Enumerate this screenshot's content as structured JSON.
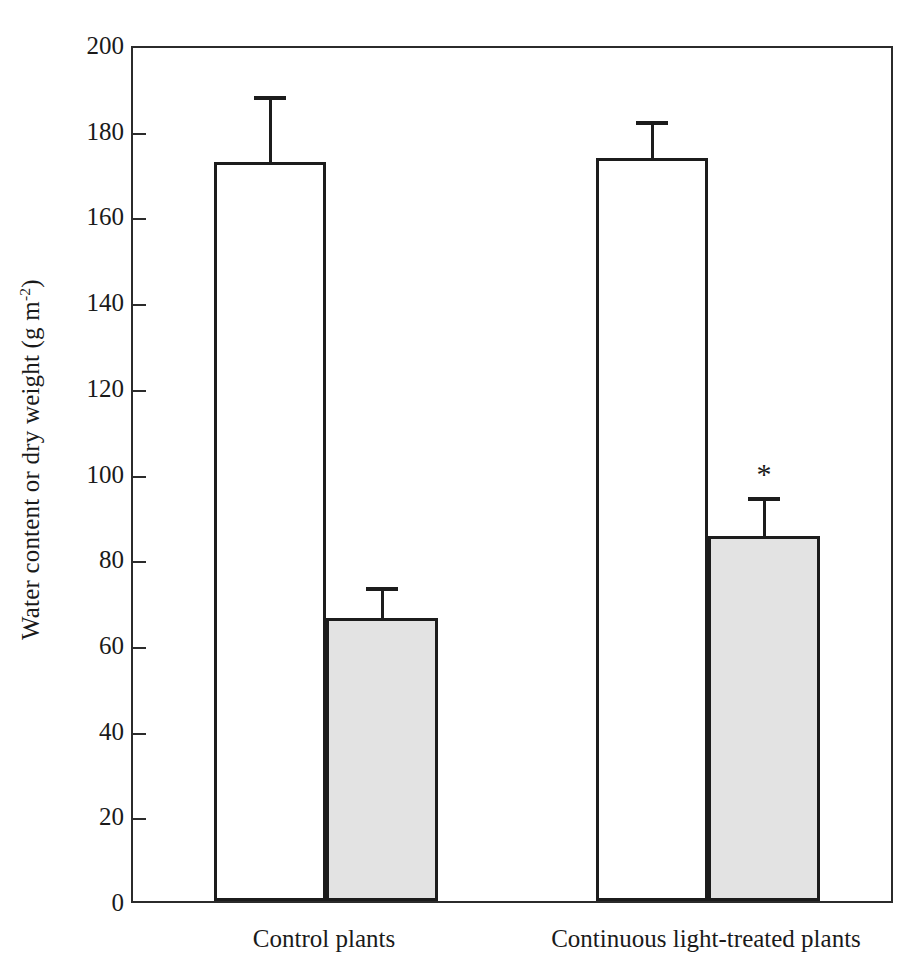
{
  "chart_data": {
    "type": "bar",
    "title": "",
    "xlabel": "",
    "ylabel": "Water content or dry weight (g m",
    "ylabel_sup": "-2",
    "ylabel_suffix": ")",
    "categories": [
      "Control plants",
      "Continuous light-treated plants"
    ],
    "series": [
      {
        "name": "Water content",
        "fill": "white",
        "values": [
          172.5,
          173.5
        ],
        "errors": [
          14.5,
          7.5
        ]
      },
      {
        "name": "Dry weight",
        "fill": "gray",
        "values": [
          66.0,
          85.3
        ],
        "errors": [
          6.3,
          8.0
        ]
      }
    ],
    "ylim": [
      0,
      200
    ],
    "ytick_labels": [
      "0",
      "20",
      "40",
      "60",
      "80",
      "100",
      "120",
      "140",
      "160",
      "180",
      "200"
    ],
    "ytick_values": [
      0,
      20,
      40,
      60,
      80,
      100,
      120,
      140,
      160,
      180,
      200
    ],
    "grid": false,
    "legend": "none",
    "annotations": [
      {
        "text": "*",
        "series_index": 1,
        "category_index": 1,
        "meaning": "significant-difference-marker"
      }
    ],
    "colors": {
      "bar_white_fill": "#ffffff",
      "bar_gray_fill": "#e3e3e3",
      "bar_outline": "#1c1c1c",
      "axis": "#2b2b2b",
      "text": "#1a1a1a",
      "background": "#ffffff"
    }
  }
}
